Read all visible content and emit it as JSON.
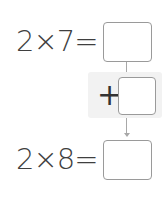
{
  "equations": [
    {
      "left": "2",
      "operator": "×",
      "right": "7",
      "equals": "=",
      "text": "2×7=",
      "answer": ""
    },
    {
      "left": "2",
      "operator": "×",
      "right": "8",
      "equals": "=",
      "text": "2×8=",
      "answer": ""
    }
  ],
  "step": {
    "operator": "+",
    "answer": ""
  },
  "colors": {
    "text": "#3f3f3f",
    "box_border": "#9a9a9a",
    "panel_bg": "#f2f2f2",
    "connector": "#a8a8a8"
  }
}
